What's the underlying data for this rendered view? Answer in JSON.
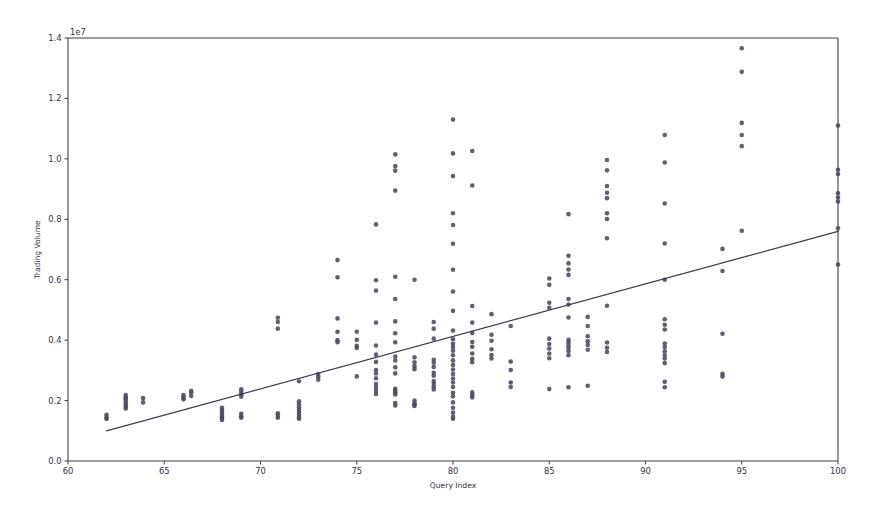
{
  "figure": {
    "width": 886,
    "height": 519,
    "background": "#ffffff"
  },
  "chart_data": {
    "type": "scatter",
    "title": "",
    "xlabel": "Query Index",
    "ylabel": "Trading Volume",
    "y_offset_text": "1e7",
    "y_offset_multiplier": 10000000,
    "xlim": [
      60,
      100
    ],
    "ylim": [
      0,
      14000000
    ],
    "xticks": [
      60,
      65,
      70,
      75,
      80,
      85,
      90,
      95,
      100
    ],
    "xticklabels": [
      "60",
      "65",
      "70",
      "75",
      "80",
      "85",
      "90",
      "95",
      "100"
    ],
    "yticks": [
      0,
      2000000,
      4000000,
      6000000,
      8000000,
      10000000,
      12000000,
      14000000
    ],
    "yticklabels": [
      "0.0",
      "0.2",
      "0.4",
      "0.6",
      "0.8",
      "1.0",
      "1.2",
      "1.4"
    ],
    "grid": false,
    "legend": null,
    "marker": {
      "shape": "circle",
      "radius_px": 2.3,
      "color": "#4a4a5e",
      "opacity": 0.88
    },
    "trendline": {
      "name": "linear-fit",
      "color": "#3c3c50",
      "width_px": 1.25,
      "x_start": 62.0,
      "y_start": 1000000,
      "x_end": 100.0,
      "y_end": 7600000
    },
    "points": [
      [
        62.0,
        1450000
      ],
      [
        62.0,
        1390000
      ],
      [
        62.0,
        1530000
      ],
      [
        63.0,
        2100000
      ],
      [
        63.0,
        2040000
      ],
      [
        63.0,
        1960000
      ],
      [
        63.0,
        1880000
      ],
      [
        63.0,
        1800000
      ],
      [
        63.0,
        1740000
      ],
      [
        63.0,
        2180000
      ],
      [
        63.9,
        2080000
      ],
      [
        63.9,
        1940000
      ],
      [
        66.0,
        2180000
      ],
      [
        66.0,
        2100000
      ],
      [
        66.0,
        2040000
      ],
      [
        66.4,
        2320000
      ],
      [
        66.4,
        2260000
      ],
      [
        66.4,
        2150000
      ],
      [
        68.0,
        1760000
      ],
      [
        68.0,
        1680000
      ],
      [
        68.0,
        1600000
      ],
      [
        68.0,
        1520000
      ],
      [
        68.0,
        1460000
      ],
      [
        68.0,
        1420000
      ],
      [
        68.0,
        1360000
      ],
      [
        69.0,
        2370000
      ],
      [
        69.0,
        2290000
      ],
      [
        69.0,
        2210000
      ],
      [
        69.0,
        2130000
      ],
      [
        69.0,
        1560000
      ],
      [
        69.0,
        1480000
      ],
      [
        69.0,
        1430000
      ],
      [
        70.9,
        4740000
      ],
      [
        70.9,
        4600000
      ],
      [
        70.9,
        4380000
      ],
      [
        70.9,
        1580000
      ],
      [
        70.9,
        1500000
      ],
      [
        70.9,
        1430000
      ],
      [
        72.0,
        2640000
      ],
      [
        72.0,
        1980000
      ],
      [
        72.0,
        1880000
      ],
      [
        72.0,
        1780000
      ],
      [
        72.0,
        1700000
      ],
      [
        72.0,
        1620000
      ],
      [
        72.0,
        1540000
      ],
      [
        72.0,
        1460000
      ],
      [
        72.0,
        1400000
      ],
      [
        73.0,
        2880000
      ],
      [
        73.0,
        2790000
      ],
      [
        73.0,
        2690000
      ],
      [
        74.0,
        6650000
      ],
      [
        74.0,
        6080000
      ],
      [
        74.0,
        4720000
      ],
      [
        74.0,
        4280000
      ],
      [
        74.0,
        4000000
      ],
      [
        74.0,
        3930000
      ],
      [
        75.0,
        4280000
      ],
      [
        75.0,
        4010000
      ],
      [
        75.0,
        3810000
      ],
      [
        75.0,
        3740000
      ],
      [
        75.0,
        2800000
      ],
      [
        76.0,
        7830000
      ],
      [
        76.0,
        5980000
      ],
      [
        76.0,
        5640000
      ],
      [
        76.0,
        4580000
      ],
      [
        76.0,
        3820000
      ],
      [
        76.0,
        3520000
      ],
      [
        76.0,
        3280000
      ],
      [
        76.0,
        3010000
      ],
      [
        76.0,
        2900000
      ],
      [
        76.0,
        2740000
      ],
      [
        76.0,
        2550000
      ],
      [
        76.0,
        2430000
      ],
      [
        76.0,
        2320000
      ],
      [
        76.0,
        2220000
      ],
      [
        77.0,
        10150000
      ],
      [
        77.0,
        9760000
      ],
      [
        77.0,
        9610000
      ],
      [
        77.0,
        8950000
      ],
      [
        77.0,
        6100000
      ],
      [
        77.0,
        5360000
      ],
      [
        77.0,
        4620000
      ],
      [
        77.0,
        4230000
      ],
      [
        77.0,
        3930000
      ],
      [
        77.0,
        3460000
      ],
      [
        77.0,
        3330000
      ],
      [
        77.0,
        3100000
      ],
      [
        77.0,
        2900000
      ],
      [
        77.0,
        2390000
      ],
      [
        77.0,
        2330000
      ],
      [
        77.0,
        2270000
      ],
      [
        77.0,
        2200000
      ],
      [
        77.0,
        1920000
      ],
      [
        77.0,
        1840000
      ],
      [
        78.0,
        6000000
      ],
      [
        78.0,
        3430000
      ],
      [
        78.0,
        3270000
      ],
      [
        78.0,
        3140000
      ],
      [
        78.0,
        3040000
      ],
      [
        78.0,
        2000000
      ],
      [
        78.0,
        1910000
      ],
      [
        78.0,
        1870000
      ],
      [
        78.0,
        1820000
      ],
      [
        79.0,
        4600000
      ],
      [
        79.0,
        4380000
      ],
      [
        79.0,
        4050000
      ],
      [
        79.0,
        3350000
      ],
      [
        79.0,
        3250000
      ],
      [
        79.0,
        3110000
      ],
      [
        79.0,
        2920000
      ],
      [
        79.0,
        2820000
      ],
      [
        79.0,
        2650000
      ],
      [
        79.0,
        2560000
      ],
      [
        79.0,
        2460000
      ],
      [
        79.0,
        2370000
      ],
      [
        80.0,
        11300000
      ],
      [
        80.0,
        10180000
      ],
      [
        80.0,
        9430000
      ],
      [
        80.0,
        8200000
      ],
      [
        80.0,
        7810000
      ],
      [
        80.0,
        7190000
      ],
      [
        80.0,
        6330000
      ],
      [
        80.0,
        5610000
      ],
      [
        80.0,
        4970000
      ],
      [
        80.0,
        4320000
      ],
      [
        80.0,
        4030000
      ],
      [
        80.0,
        3880000
      ],
      [
        80.0,
        3770000
      ],
      [
        80.0,
        3650000
      ],
      [
        80.0,
        3500000
      ],
      [
        80.0,
        3330000
      ],
      [
        80.0,
        3180000
      ],
      [
        80.0,
        3030000
      ],
      [
        80.0,
        2880000
      ],
      [
        80.0,
        2730000
      ],
      [
        80.0,
        2600000
      ],
      [
        80.0,
        2450000
      ],
      [
        80.0,
        2260000
      ],
      [
        80.0,
        2140000
      ],
      [
        80.0,
        1940000
      ],
      [
        80.0,
        1760000
      ],
      [
        80.0,
        1600000
      ],
      [
        80.0,
        1460000
      ],
      [
        80.0,
        1400000
      ],
      [
        81.0,
        10260000
      ],
      [
        81.0,
        9120000
      ],
      [
        81.0,
        5130000
      ],
      [
        81.0,
        4580000
      ],
      [
        81.0,
        4240000
      ],
      [
        81.0,
        3940000
      ],
      [
        81.0,
        3780000
      ],
      [
        81.0,
        3560000
      ],
      [
        81.0,
        3380000
      ],
      [
        81.0,
        3270000
      ],
      [
        81.0,
        2270000
      ],
      [
        81.0,
        2180000
      ],
      [
        81.0,
        2100000
      ],
      [
        82.0,
        4860000
      ],
      [
        82.0,
        4180000
      ],
      [
        82.0,
        3980000
      ],
      [
        82.0,
        3700000
      ],
      [
        82.0,
        3510000
      ],
      [
        82.0,
        3390000
      ],
      [
        83.0,
        4470000
      ],
      [
        83.0,
        3290000
      ],
      [
        83.0,
        3010000
      ],
      [
        83.0,
        2600000
      ],
      [
        83.0,
        2450000
      ],
      [
        85.0,
        6040000
      ],
      [
        85.0,
        5830000
      ],
      [
        85.0,
        5240000
      ],
      [
        85.0,
        5070000
      ],
      [
        85.0,
        4050000
      ],
      [
        85.0,
        3870000
      ],
      [
        85.0,
        3720000
      ],
      [
        85.0,
        3560000
      ],
      [
        85.0,
        3400000
      ],
      [
        85.0,
        2380000
      ],
      [
        86.0,
        8170000
      ],
      [
        86.0,
        6790000
      ],
      [
        86.0,
        6540000
      ],
      [
        86.0,
        6340000
      ],
      [
        86.0,
        6160000
      ],
      [
        86.0,
        5360000
      ],
      [
        86.0,
        5180000
      ],
      [
        86.0,
        4750000
      ],
      [
        86.0,
        4010000
      ],
      [
        86.0,
        3930000
      ],
      [
        86.0,
        3830000
      ],
      [
        86.0,
        3740000
      ],
      [
        86.0,
        3630000
      ],
      [
        86.0,
        3500000
      ],
      [
        86.0,
        2440000
      ],
      [
        87.0,
        4770000
      ],
      [
        87.0,
        4470000
      ],
      [
        87.0,
        4130000
      ],
      [
        87.0,
        3960000
      ],
      [
        87.0,
        3840000
      ],
      [
        87.0,
        3680000
      ],
      [
        87.0,
        2490000
      ],
      [
        88.0,
        9960000
      ],
      [
        88.0,
        9620000
      ],
      [
        88.0,
        9100000
      ],
      [
        88.0,
        8880000
      ],
      [
        88.0,
        8700000
      ],
      [
        88.0,
        8200000
      ],
      [
        88.0,
        8010000
      ],
      [
        88.0,
        7370000
      ],
      [
        88.0,
        5140000
      ],
      [
        88.0,
        3920000
      ],
      [
        88.0,
        3750000
      ],
      [
        88.0,
        3610000
      ],
      [
        91.0,
        10790000
      ],
      [
        91.0,
        9880000
      ],
      [
        91.0,
        8520000
      ],
      [
        91.0,
        7200000
      ],
      [
        91.0,
        6000000
      ],
      [
        91.0,
        4690000
      ],
      [
        91.0,
        4510000
      ],
      [
        91.0,
        4350000
      ],
      [
        91.0,
        3890000
      ],
      [
        91.0,
        3770000
      ],
      [
        91.0,
        3630000
      ],
      [
        91.0,
        3510000
      ],
      [
        91.0,
        3390000
      ],
      [
        91.0,
        3240000
      ],
      [
        91.0,
        2620000
      ],
      [
        91.0,
        2440000
      ],
      [
        94.0,
        7020000
      ],
      [
        94.0,
        6290000
      ],
      [
        94.0,
        4210000
      ],
      [
        94.0,
        2890000
      ],
      [
        94.0,
        2800000
      ],
      [
        95.0,
        13660000
      ],
      [
        95.0,
        12880000
      ],
      [
        95.0,
        11190000
      ],
      [
        95.0,
        10790000
      ],
      [
        95.0,
        10420000
      ],
      [
        95.0,
        7620000
      ],
      [
        100.0,
        11100000
      ],
      [
        100.0,
        9640000
      ],
      [
        100.0,
        9500000
      ],
      [
        100.0,
        8860000
      ],
      [
        100.0,
        8720000
      ],
      [
        100.0,
        8590000
      ],
      [
        100.0,
        7700000
      ],
      [
        100.0,
        6500000
      ]
    ]
  },
  "axes_geometry": {
    "left_px": 68,
    "right_px": 838,
    "top_px": 38,
    "bottom_px": 461
  }
}
